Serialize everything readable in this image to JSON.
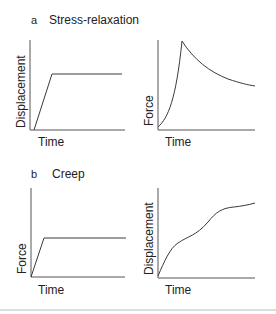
{
  "panels": {
    "a": {
      "letter": "a",
      "title": "Stress-relaxation",
      "left": {
        "ylabel": "Displacement",
        "xlabel": "Time"
      },
      "right": {
        "ylabel": "Force",
        "xlabel": "Time"
      }
    },
    "b": {
      "letter": "b",
      "title": "Creep",
      "left": {
        "ylabel": "Force",
        "xlabel": "Time"
      },
      "right": {
        "ylabel": "Displacement",
        "xlabel": "Time"
      }
    }
  },
  "colors": {
    "line": "#3a3a3a",
    "axis": "#555555",
    "divider": "#bbbbbb"
  }
}
